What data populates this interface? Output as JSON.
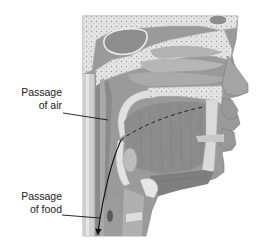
{
  "figure": {
    "labels": [
      {
        "id": "air",
        "line1": "Passage",
        "line2": "of air"
      },
      {
        "id": "food",
        "line1": "Passage",
        "line2": "of food"
      }
    ],
    "colors": {
      "background": "#ffffff",
      "tissue_dark": "#8a8a8a",
      "tissue_mid": "#a6a6a6",
      "tissue_light": "#c4c4c4",
      "bone": "#e6e6e6",
      "bone_dots": "#9a9a9a",
      "line": "#1a1a1a"
    }
  }
}
